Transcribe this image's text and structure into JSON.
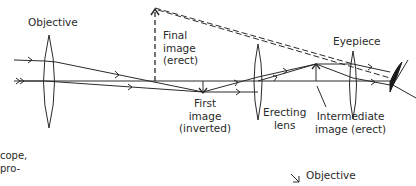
{
  "diagram": {
    "labels": {
      "objective": "Objective",
      "final_image": [
        "Final",
        "image",
        "(erect)"
      ],
      "eyepiece": "Eyepiece",
      "first_image": [
        "First",
        "image",
        "(inverted)"
      ],
      "erecting_lens": [
        "Erecting",
        "lens"
      ],
      "intermediate_image": [
        "Intermediate",
        "image (erect)"
      ],
      "caption_fragment": [
        "cope,",
        "pro-"
      ],
      "bottom_objective": "Objective"
    },
    "colors": {
      "line": "#2a2a2a",
      "background": "#ffffff"
    }
  }
}
